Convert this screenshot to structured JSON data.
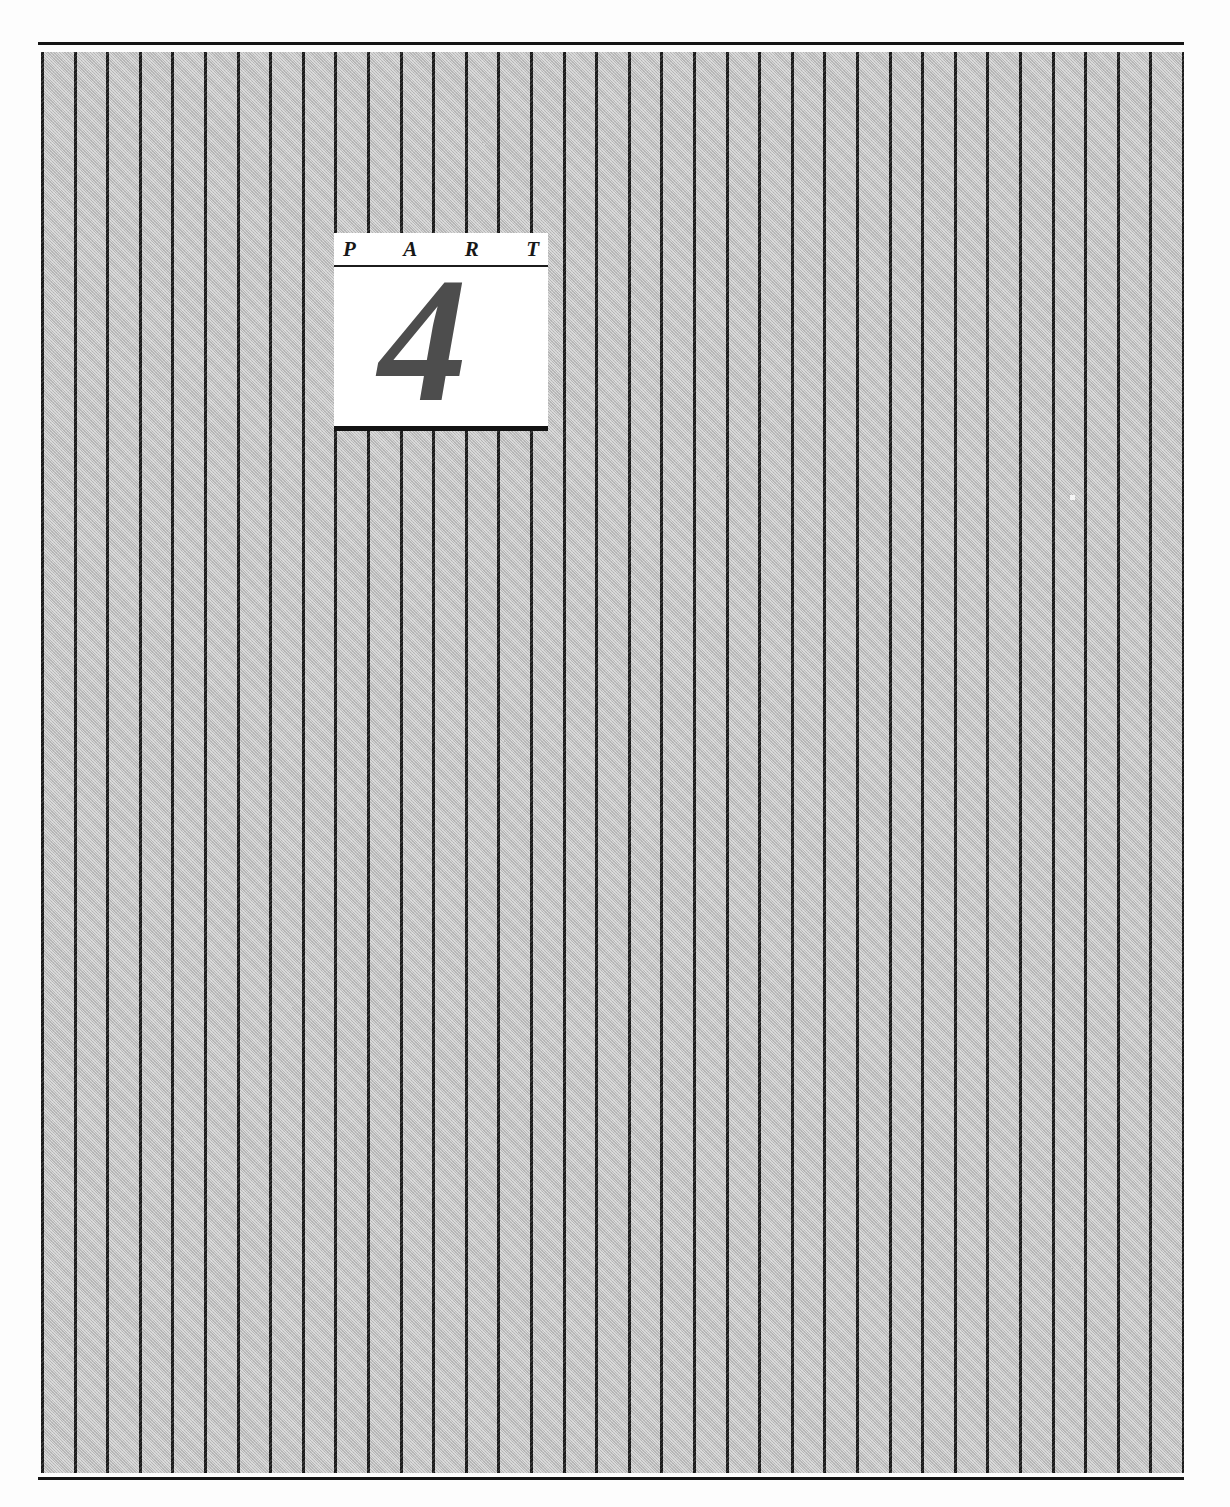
{
  "page": {
    "kind": "book-part-divider",
    "background_color": "#ffffff",
    "rule_color": "#141414"
  },
  "panel": {
    "name": "striped-halftone-panel",
    "fill_color": "#c6c6c6",
    "stripe_color": "#1b1b1b",
    "stripe_spacing_px": 32.6,
    "stripe_width_px": 3,
    "stripe_count": 36
  },
  "part_label": {
    "word_letters": [
      "P",
      "A",
      "R",
      "T"
    ],
    "word": "PART",
    "number": "4",
    "box_background": "#ffffff",
    "number_color": "#4d4d4d",
    "rule_color": "#1c1c1c",
    "shadow_color": "#121212"
  }
}
